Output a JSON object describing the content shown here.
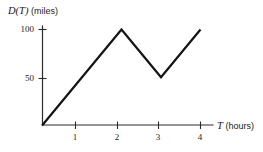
{
  "chart_data": {
    "type": "line",
    "title": "",
    "subtitle": "",
    "xlabel_var": "T",
    "xlabel_unit": "(hours)",
    "ylabel_var": "D(T)",
    "ylabel_unit": "(miles)",
    "x": [
      0,
      2,
      3,
      4
    ],
    "values": [
      0,
      100,
      50,
      100
    ],
    "series": [
      {
        "name": "D(T)",
        "points": [
          {
            "x": 0,
            "y": 0
          },
          {
            "x": 2,
            "y": 100
          },
          {
            "x": 3,
            "y": 50
          },
          {
            "x": 4,
            "y": 100
          }
        ]
      }
    ],
    "xticks": [
      1,
      2,
      3,
      4
    ],
    "xtick_labels": [
      "1",
      "2",
      "3",
      "4"
    ],
    "yticks": [
      50,
      100
    ],
    "ytick_labels": [
      "50",
      "100"
    ],
    "xlim": [
      0,
      4.3
    ],
    "ylim": [
      0,
      110
    ],
    "grid": false,
    "legend": false,
    "legend_position": "none",
    "line_color": "#141414",
    "axis_color": "#2b2b2b",
    "background_color": "#ffffff",
    "annotations": []
  },
  "axes": {
    "y_title_var": "D(T)",
    "y_title_unit": "(miles)",
    "x_title_var": "T",
    "x_title_unit": "(hours)"
  },
  "ticks": {
    "y": [
      {
        "label": "100",
        "value": 100
      },
      {
        "label": "50",
        "value": 50
      }
    ],
    "x": [
      {
        "label": "1",
        "value": 1
      },
      {
        "label": "2",
        "value": 2
      },
      {
        "label": "3",
        "value": 3
      },
      {
        "label": "4",
        "value": 4
      }
    ]
  }
}
